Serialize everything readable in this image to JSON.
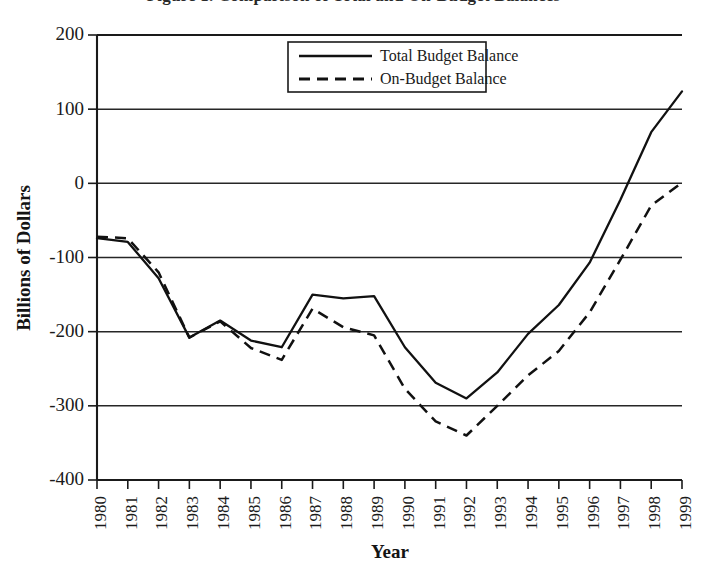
{
  "page": {
    "clipped_title": "Figure 1. Comparison of Total and On-Budget Balances"
  },
  "chart_data": {
    "type": "line",
    "title": "",
    "xlabel": "Year",
    "ylabel": "Billions of Dollars",
    "x": [
      1980,
      1981,
      1982,
      1983,
      1984,
      1985,
      1986,
      1987,
      1988,
      1989,
      1990,
      1991,
      1992,
      1993,
      1994,
      1995,
      1996,
      1997,
      1998,
      1999
    ],
    "categories": [
      "1980",
      "1981",
      "1982",
      "1983",
      "1984",
      "1985",
      "1986",
      "1987",
      "1988",
      "1989",
      "1990",
      "1991",
      "1992",
      "1993",
      "1994",
      "1995",
      "1996",
      "1997",
      "1998",
      "1999"
    ],
    "xlim": [
      1980,
      1999
    ],
    "ylim": [
      -400,
      200
    ],
    "yticks": [
      200,
      100,
      0,
      -100,
      -200,
      -300,
      -400
    ],
    "ytick_labels": [
      "200",
      "100",
      "0",
      "-100",
      "-200",
      "-300",
      "-400"
    ],
    "grid": "horizontal",
    "legend_position": "top-center",
    "series": [
      {
        "name": "Total Budget Balance",
        "style": "solid",
        "color": "#111111",
        "values": [
          -74,
          -79,
          -128,
          -208,
          -185,
          -212,
          -221,
          -150,
          -155,
          -152,
          -221,
          -269,
          -290,
          -255,
          -203,
          -164,
          -107,
          -22,
          69,
          124
        ]
      },
      {
        "name": "On-Budget Balance",
        "style": "dashed",
        "color": "#111111",
        "values": [
          -72,
          -74,
          -120,
          -208,
          -186,
          -222,
          -238,
          -169,
          -194,
          -205,
          -277,
          -321,
          -340,
          -300,
          -259,
          -226,
          -174,
          -103,
          -30,
          1
        ]
      }
    ]
  },
  "legend": {
    "entries": [
      {
        "label": "Total Budget Balance",
        "style": "solid"
      },
      {
        "label": "On-Budget Balance",
        "style": "dashed"
      }
    ]
  }
}
